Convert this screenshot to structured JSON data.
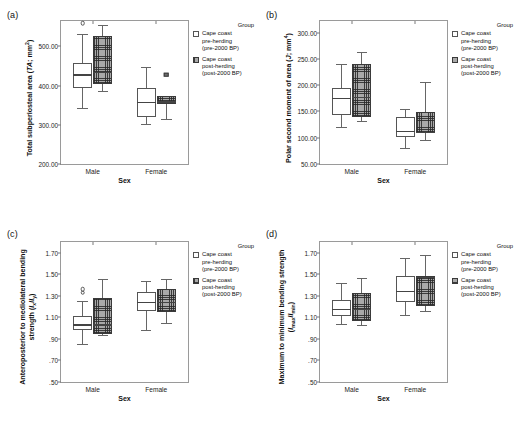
{
  "figure": {
    "panels": [
      "a",
      "b",
      "c",
      "d"
    ],
    "legend": {
      "title": "Group",
      "items": [
        {
          "swatch": "open",
          "lines": [
            "Cape coast",
            "pre-herding",
            "(pre-2000 BP)"
          ]
        },
        {
          "swatch": "hatch",
          "lines": [
            "Cape coast",
            "post-herding",
            "(post-2000 BP)"
          ]
        }
      ]
    }
  },
  "chart_data": [
    {
      "panel": "a",
      "type": "box",
      "title": "",
      "ylabel": "Total subperiosteal area (TA; mm2)",
      "ylabel_html": "Total subperiosteal area (<i>TA</i>; mm<sup>2</sup>)",
      "xlabel": "Sex",
      "categories": [
        "Male",
        "Female"
      ],
      "yticks": [
        "200.00",
        "300.00",
        "400.00",
        "500.00"
      ],
      "ytick_values": [
        200,
        300,
        400,
        500
      ],
      "ylim": [
        200,
        565
      ],
      "grid": false,
      "legend_position": "right",
      "series": [
        {
          "name": "Cape coast pre-herding (pre-2000 BP)",
          "fill": "open",
          "boxes": [
            {
              "category": "Male",
              "whisker_low": 344,
              "q1": 394,
              "median": 427,
              "q3": 457,
              "whisker_high": 533,
              "outliers": [
                559
              ]
            },
            {
              "category": "Female",
              "whisker_low": 303,
              "q1": 321,
              "median": 356,
              "q3": 394,
              "whisker_high": 448,
              "outliers": []
            }
          ]
        },
        {
          "name": "Cape coast post-herding (post-2000 BP)",
          "fill": "hatch",
          "boxes": [
            {
              "category": "Male",
              "whisker_low": 386,
              "q1": 404,
              "median": 434,
              "q3": 526,
              "whisker_high": 554,
              "outliers": []
            },
            {
              "category": "Female",
              "whisker_low": 316,
              "q1": 354,
              "median": 358,
              "q3": 373,
              "whisker_high": 373,
              "outliers": [
                428
              ]
            }
          ]
        }
      ]
    },
    {
      "panel": "b",
      "type": "box",
      "title": "",
      "ylabel": "Polar second moment of area (J; mm4)",
      "ylabel_html": "Polar second moment of area (<i>J</i>; mm<sup>4</sup>)",
      "xlabel": "Sex",
      "categories": [
        "Male",
        "Female"
      ],
      "yticks": [
        "50.00",
        "100.00",
        "150.00",
        "200.00",
        "250.00",
        "300.00"
      ],
      "ytick_values": [
        50,
        100,
        150,
        200,
        250,
        300
      ],
      "ylim": [
        50,
        322
      ],
      "grid": false,
      "legend_position": "right",
      "series": [
        {
          "name": "Cape coast pre-herding (pre-2000 BP)",
          "fill": "open",
          "boxes": [
            {
              "category": "Male",
              "whisker_low": 121,
              "q1": 143,
              "median": 175,
              "q3": 195,
              "whisker_high": 240,
              "outliers": []
            },
            {
              "category": "Female",
              "whisker_low": 80,
              "q1": 102,
              "median": 112,
              "q3": 139,
              "whisker_high": 155,
              "outliers": []
            }
          ]
        },
        {
          "name": "Cape coast post-herding (post-2000 BP)",
          "fill": "hatch",
          "boxes": [
            {
              "category": "Male",
              "whisker_low": 131,
              "q1": 139,
              "median": 177,
              "q3": 240,
              "whisker_high": 263,
              "outliers": []
            },
            {
              "category": "Female",
              "whisker_low": 95,
              "q1": 109,
              "median": 110,
              "q3": 149,
              "whisker_high": 206,
              "outliers": []
            }
          ]
        }
      ]
    },
    {
      "panel": "c",
      "type": "box",
      "title": "",
      "ylabel": "Anteroposterior to mediolateral bending strength (Ix/Iy)",
      "ylabel_html": "Anteroposterior to mediolateral bending strength (<i>I</i><sub>x</sub>/<i>I</i><sub>y</sub>)",
      "xlabel": "Sex",
      "categories": [
        "Male",
        "Female"
      ],
      "yticks": [
        ".50",
        ".70",
        ".90",
        "1.10",
        "1.30",
        "1.50",
        "1.70"
      ],
      "ytick_values": [
        0.5,
        0.7,
        0.9,
        1.1,
        1.3,
        1.5,
        1.7
      ],
      "ylim": [
        0.5,
        1.8
      ],
      "grid": false,
      "legend_position": "right",
      "series": [
        {
          "name": "Cape coast pre-herding (pre-2000 BP)",
          "fill": "open",
          "boxes": [
            {
              "category": "Male",
              "whisker_low": 0.85,
              "q1": 0.98,
              "median": 1.03,
              "q3": 1.11,
              "whisker_high": 1.25,
              "outliers": [
                1.36,
                1.33
              ]
            },
            {
              "category": "Female",
              "whisker_low": 0.98,
              "q1": 1.16,
              "median": 1.24,
              "q3": 1.34,
              "whisker_high": 1.44,
              "outliers": []
            }
          ]
        },
        {
          "name": "Cape coast post-herding (post-2000 BP)",
          "fill": "hatch",
          "boxes": [
            {
              "category": "Male",
              "whisker_low": 0.94,
              "q1": 0.95,
              "median": 1.03,
              "q3": 1.28,
              "whisker_high": 1.46,
              "outliers": []
            },
            {
              "category": "Female",
              "whisker_low": 1.05,
              "q1": 1.15,
              "median": 1.24,
              "q3": 1.36,
              "whisker_high": 1.46,
              "outliers": []
            }
          ]
        }
      ]
    },
    {
      "panel": "d",
      "type": "box",
      "title": "",
      "ylabel": "Maximum to minimum bending strength (Imax/Imin)",
      "ylabel_html": "Maximum to minimum bending strength (<i>I</i><sub>max</sub>/<i>I</i><sub>min</sub>)",
      "xlabel": "Sex",
      "categories": [
        "Male",
        "Female"
      ],
      "yticks": [
        ".50",
        ".70",
        ".90",
        "1.10",
        "1.30",
        "1.50",
        "1.70"
      ],
      "ytick_values": [
        0.5,
        0.7,
        0.9,
        1.1,
        1.3,
        1.5,
        1.7
      ],
      "ylim": [
        0.5,
        1.8
      ],
      "grid": false,
      "legend_position": "right",
      "series": [
        {
          "name": "Cape coast pre-herding (pre-2000 BP)",
          "fill": "open",
          "boxes": [
            {
              "category": "Male",
              "whisker_low": 1.04,
              "q1": 1.11,
              "median": 1.17,
              "q3": 1.26,
              "whisker_high": 1.42,
              "outliers": []
            },
            {
              "category": "Female",
              "whisker_low": 1.12,
              "q1": 1.24,
              "median": 1.34,
              "q3": 1.48,
              "whisker_high": 1.65,
              "outliers": []
            }
          ]
        },
        {
          "name": "Cape coast post-herding (post-2000 BP)",
          "fill": "hatch",
          "boxes": [
            {
              "category": "Male",
              "whisker_low": 1.03,
              "q1": 1.07,
              "median": 1.17,
              "q3": 1.33,
              "whisker_high": 1.47,
              "outliers": []
            },
            {
              "category": "Female",
              "whisker_low": 1.16,
              "q1": 1.21,
              "median": 1.47,
              "q3": 1.48,
              "whisker_high": 1.68,
              "outliers": []
            }
          ]
        }
      ]
    }
  ]
}
